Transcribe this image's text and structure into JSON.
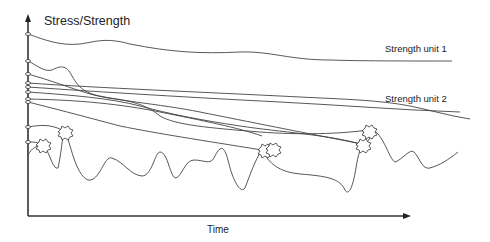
{
  "diagram": {
    "y_axis_label": "Stress/Strength",
    "x_axis_label": "Time",
    "curve_labels": {
      "strength_unit_1": "Strength unit 1",
      "strength_unit_2": "Strength unit 2"
    },
    "strength_curve_count": 9,
    "failure_markers": 6,
    "colors": {
      "line": "#444444",
      "background": "#ffffff"
    }
  }
}
